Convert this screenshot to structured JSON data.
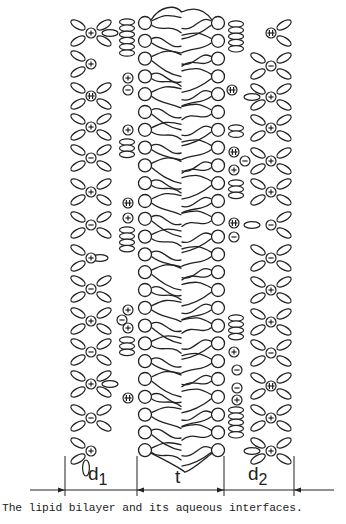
{
  "figure": {
    "caption": "The lipid bilayer and its aqueous interfaces.",
    "stroke_color": "#222222",
    "background": "#ffffff",
    "labels": {
      "d1": "d",
      "d1_sub": "1",
      "t": "t",
      "d2": "d",
      "d2_sub": "2"
    },
    "dimension_line": {
      "y": 490,
      "x_start": 30,
      "x_end": 334,
      "ticks_x": [
        65,
        137,
        224,
        294
      ],
      "tick_top": 456,
      "tick_bottom": 500
    },
    "bilayer": {
      "left_head_x": 145,
      "right_head_x": 218,
      "head_radius": 6.5,
      "head_count": 25,
      "first_head_y": 23,
      "head_spacing": 17.8
    },
    "ions": [
      {
        "x": 91,
        "y": 33,
        "type": "plus"
      },
      {
        "x": 91,
        "y": 64,
        "type": "plus"
      },
      {
        "x": 91,
        "y": 96,
        "type": "plusminus"
      },
      {
        "x": 128,
        "y": 78,
        "type": "plus"
      },
      {
        "x": 128,
        "y": 90,
        "type": "minus"
      },
      {
        "x": 91,
        "y": 127,
        "type": "plus"
      },
      {
        "x": 91,
        "y": 158,
        "type": "minus"
      },
      {
        "x": 128,
        "y": 130,
        "type": "plus"
      },
      {
        "x": 91,
        "y": 192,
        "type": "plus"
      },
      {
        "x": 128,
        "y": 203,
        "type": "plusminus"
      },
      {
        "x": 128,
        "y": 218,
        "type": "plus"
      },
      {
        "x": 91,
        "y": 225,
        "type": "minus"
      },
      {
        "x": 91,
        "y": 258,
        "type": "plus"
      },
      {
        "x": 91,
        "y": 289,
        "type": "minus"
      },
      {
        "x": 91,
        "y": 321,
        "type": "plus"
      },
      {
        "x": 128,
        "y": 310,
        "type": "plus"
      },
      {
        "x": 122,
        "y": 320,
        "type": "minus"
      },
      {
        "x": 128,
        "y": 328,
        "type": "plus"
      },
      {
        "x": 91,
        "y": 352,
        "type": "minus"
      },
      {
        "x": 91,
        "y": 384,
        "type": "plus"
      },
      {
        "x": 128,
        "y": 398,
        "type": "plusminus"
      },
      {
        "x": 91,
        "y": 418,
        "type": "minus"
      },
      {
        "x": 91,
        "y": 451,
        "type": "plus"
      },
      {
        "x": 271,
        "y": 33,
        "type": "plusminus"
      },
      {
        "x": 271,
        "y": 66,
        "type": "minus"
      },
      {
        "x": 232,
        "y": 90,
        "type": "plusminus"
      },
      {
        "x": 271,
        "y": 97,
        "type": "plus"
      },
      {
        "x": 271,
        "y": 128,
        "type": "plus"
      },
      {
        "x": 234,
        "y": 152,
        "type": "plusminus"
      },
      {
        "x": 245,
        "y": 161,
        "type": "minus"
      },
      {
        "x": 271,
        "y": 161,
        "type": "plus"
      },
      {
        "x": 234,
        "y": 170,
        "type": "plus"
      },
      {
        "x": 271,
        "y": 192,
        "type": "plus"
      },
      {
        "x": 234,
        "y": 223,
        "type": "plusminus"
      },
      {
        "x": 234,
        "y": 237,
        "type": "minus"
      },
      {
        "x": 271,
        "y": 225,
        "type": "minus"
      },
      {
        "x": 271,
        "y": 258,
        "type": "minus"
      },
      {
        "x": 271,
        "y": 290,
        "type": "plus"
      },
      {
        "x": 271,
        "y": 322,
        "type": "plus"
      },
      {
        "x": 234,
        "y": 352,
        "type": "plus"
      },
      {
        "x": 271,
        "y": 353,
        "type": "minus"
      },
      {
        "x": 237,
        "y": 370,
        "type": "minus"
      },
      {
        "x": 237,
        "y": 388,
        "type": "minus"
      },
      {
        "x": 271,
        "y": 386,
        "type": "plusminus"
      },
      {
        "x": 237,
        "y": 400,
        "type": "plus"
      },
      {
        "x": 271,
        "y": 418,
        "type": "plus"
      },
      {
        "x": 271,
        "y": 451,
        "type": "plus"
      }
    ],
    "water_stacks": [
      {
        "x": 127,
        "y_start": 22,
        "count": 6
      },
      {
        "x": 127,
        "y_start": 142,
        "count": 3
      },
      {
        "x": 127,
        "y_start": 230,
        "count": 4
      },
      {
        "x": 127,
        "y_start": 340,
        "count": 3
      },
      {
        "x": 236,
        "y_start": 24,
        "count": 5
      },
      {
        "x": 236,
        "y_start": 128,
        "count": 2
      },
      {
        "x": 236,
        "y_start": 183,
        "count": 3
      },
      {
        "x": 236,
        "y_start": 318,
        "count": 4
      },
      {
        "x": 236,
        "y_start": 410,
        "count": 5
      }
    ],
    "hydration_shells": [
      {
        "x": 91,
        "y": 33,
        "left": true,
        "right": true
      },
      {
        "x": 91,
        "y": 64,
        "left": true,
        "right": false
      },
      {
        "x": 91,
        "y": 96,
        "left": true,
        "right": true
      },
      {
        "x": 91,
        "y": 127,
        "left": true,
        "right": true
      },
      {
        "x": 91,
        "y": 158,
        "left": true,
        "right": true
      },
      {
        "x": 91,
        "y": 192,
        "left": true,
        "right": true
      },
      {
        "x": 91,
        "y": 225,
        "left": true,
        "right": true
      },
      {
        "x": 91,
        "y": 258,
        "left": true,
        "right": false
      },
      {
        "x": 91,
        "y": 289,
        "left": true,
        "right": true
      },
      {
        "x": 91,
        "y": 321,
        "left": true,
        "right": true
      },
      {
        "x": 91,
        "y": 352,
        "left": true,
        "right": true
      },
      {
        "x": 91,
        "y": 384,
        "left": true,
        "right": true
      },
      {
        "x": 91,
        "y": 418,
        "left": true,
        "right": true
      },
      {
        "x": 91,
        "y": 451,
        "left": true,
        "right": false
      },
      {
        "x": 271,
        "y": 33,
        "left": false,
        "right": true
      },
      {
        "x": 271,
        "y": 66,
        "left": true,
        "right": true
      },
      {
        "x": 271,
        "y": 97,
        "left": true,
        "right": true
      },
      {
        "x": 271,
        "y": 128,
        "left": true,
        "right": true
      },
      {
        "x": 271,
        "y": 161,
        "left": true,
        "right": true
      },
      {
        "x": 271,
        "y": 192,
        "left": true,
        "right": true
      },
      {
        "x": 271,
        "y": 225,
        "left": false,
        "right": true
      },
      {
        "x": 271,
        "y": 258,
        "left": true,
        "right": true
      },
      {
        "x": 271,
        "y": 290,
        "left": true,
        "right": true
      },
      {
        "x": 271,
        "y": 322,
        "left": true,
        "right": true
      },
      {
        "x": 271,
        "y": 353,
        "left": true,
        "right": true
      },
      {
        "x": 271,
        "y": 386,
        "left": true,
        "right": true
      },
      {
        "x": 271,
        "y": 418,
        "left": true,
        "right": true
      },
      {
        "x": 271,
        "y": 451,
        "left": true,
        "right": true
      }
    ],
    "loose_water": [
      {
        "x": 110,
        "y": 33,
        "rot": 0
      },
      {
        "x": 252,
        "y": 97,
        "rot": 0
      },
      {
        "x": 252,
        "y": 225,
        "rot": 0
      },
      {
        "x": 110,
        "y": 384,
        "rot": 0
      },
      {
        "x": 252,
        "y": 451,
        "rot": 0
      },
      {
        "x": 86,
        "y": 468,
        "rot": 90
      },
      {
        "x": 100,
        "y": 258,
        "rot": 0
      }
    ]
  }
}
